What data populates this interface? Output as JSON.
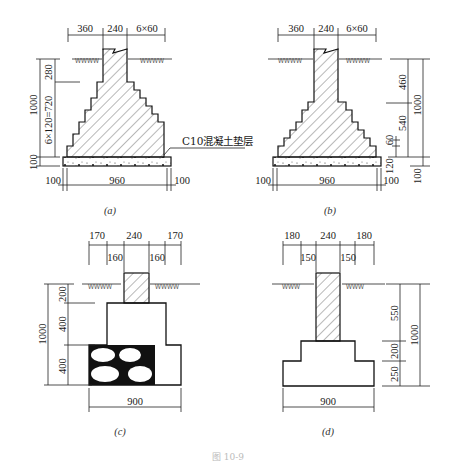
{
  "figure_caption": "图 10-9",
  "panels": {
    "a": {
      "caption": "(a)",
      "top_dims": [
        "360",
        "240",
        "6×60"
      ],
      "left_dims": [
        "280",
        "6×120=720",
        "1000",
        "100"
      ],
      "bottom_dims": [
        "100",
        "960",
        "100"
      ],
      "callout": "C10混凝土垫层"
    },
    "b": {
      "caption": "(b)",
      "top_dims": [
        "360",
        "240",
        "6×60"
      ],
      "right_dims": [
        "460",
        "540",
        "60",
        "120",
        "1000",
        "100"
      ],
      "bottom_dims": [
        "100",
        "960",
        "100"
      ]
    },
    "c": {
      "caption": "(c)",
      "top_dims": [
        "170",
        "240",
        "170"
      ],
      "inner_dims": [
        "160",
        "160"
      ],
      "left_dims": [
        "200",
        "400",
        "1000",
        "400"
      ],
      "bottom_dims": [
        "900"
      ]
    },
    "d": {
      "caption": "(d)",
      "top_dims": [
        "180",
        "240",
        "180"
      ],
      "inner_dims": [
        "150",
        "150"
      ],
      "right_dims": [
        "550",
        "200",
        "250",
        "1000"
      ],
      "bottom_dims": [
        "900"
      ]
    }
  }
}
